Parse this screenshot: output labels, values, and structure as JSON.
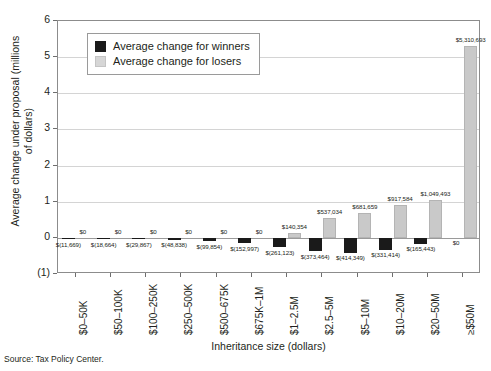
{
  "source_note": "Source: Tax Policy Center.",
  "legend": {
    "position": "inside-top-left",
    "items": [
      {
        "key": "winners",
        "label": "Average change for winners",
        "color": "#1a1a1a"
      },
      {
        "key": "losers",
        "label": "Average change for losers",
        "color": "#c9c9c9"
      }
    ]
  },
  "chart_data": {
    "type": "bar",
    "title": "",
    "xlabel": "Inheritance size (dollars)",
    "ylabel": "Average change under proposal (millions of dollars)",
    "ylim": [
      -1,
      6
    ],
    "yticks": [
      6,
      5,
      4,
      3,
      2,
      1,
      0,
      -1
    ],
    "ytick_labels": [
      "6",
      "5",
      "4",
      "3",
      "2",
      "1",
      "0",
      "(1)"
    ],
    "grid": true,
    "grouped": true,
    "categories": [
      "$0–50K",
      "$50–100K",
      "$100–250K",
      "$250–500K",
      "$500–675K",
      "$675K–1M",
      "$1–2.5M",
      "$2.5–5M",
      "$5–10M",
      "$10–20M",
      "$20–50M",
      "≥$50M"
    ],
    "series": [
      {
        "name": "Average change for winners",
        "color": "#1a1a1a",
        "values": [
          -11669,
          -18664,
          -29867,
          -48838,
          -99854,
          -152997,
          -261123,
          -373464,
          -414349,
          -331414,
          -165443,
          0
        ],
        "data_labels": [
          "$(11,669)",
          "$(18,664)",
          "$(29,867)",
          "$(48,838)",
          "$(99,854)",
          "$(152,997)",
          "$(261,123)",
          "$(373,464)",
          "$(414,349)",
          "$(331,414)",
          "$(165,443)",
          "$0"
        ]
      },
      {
        "name": "Average change for losers",
        "color": "#c9c9c9",
        "values": [
          0,
          0,
          0,
          0,
          0,
          0,
          140354,
          537034,
          681659,
          917584,
          1049493,
          5310693
        ],
        "data_labels": [
          "$0",
          "$0",
          "$0",
          "$0",
          "$0",
          "$0",
          "$140,354",
          "$537,034",
          "$681,659",
          "$917,584",
          "$1,049,493",
          "$5,310,693"
        ]
      }
    ]
  }
}
